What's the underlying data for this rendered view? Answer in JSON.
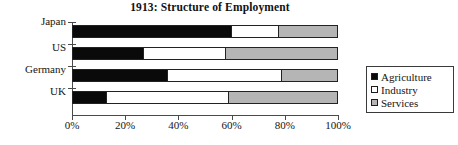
{
  "chart_data": {
    "type": "bar",
    "orientation": "horizontal",
    "stacked": true,
    "stacked_percent": true,
    "title": "1913:  Structure of Employment",
    "xlabel": "",
    "ylabel": "",
    "xlim": [
      0,
      100
    ],
    "grid": false,
    "categories": [
      "Japan",
      "US",
      "Germany",
      "UK"
    ],
    "xtick_labels": [
      "0%",
      "20%",
      "40%",
      "60%",
      "80%",
      "100%"
    ],
    "xtick_values": [
      0,
      20,
      40,
      60,
      80,
      100
    ],
    "legend_position": "right",
    "series": [
      {
        "name": "Agriculture",
        "color": "#0a0a0a",
        "values": [
          60,
          27,
          36,
          13
        ]
      },
      {
        "name": "Industry",
        "color": "#ffffff",
        "values": [
          18,
          31,
          43,
          46
        ]
      },
      {
        "name": "Services",
        "color": "#b5b5b5",
        "values": [
          22,
          42,
          21,
          41
        ]
      }
    ],
    "annotations": []
  },
  "legend": {
    "items": [
      {
        "label": "Agriculture",
        "swatch": "agriculture"
      },
      {
        "label": "Industry",
        "swatch": "industry"
      },
      {
        "label": "Services",
        "swatch": "services"
      }
    ]
  }
}
